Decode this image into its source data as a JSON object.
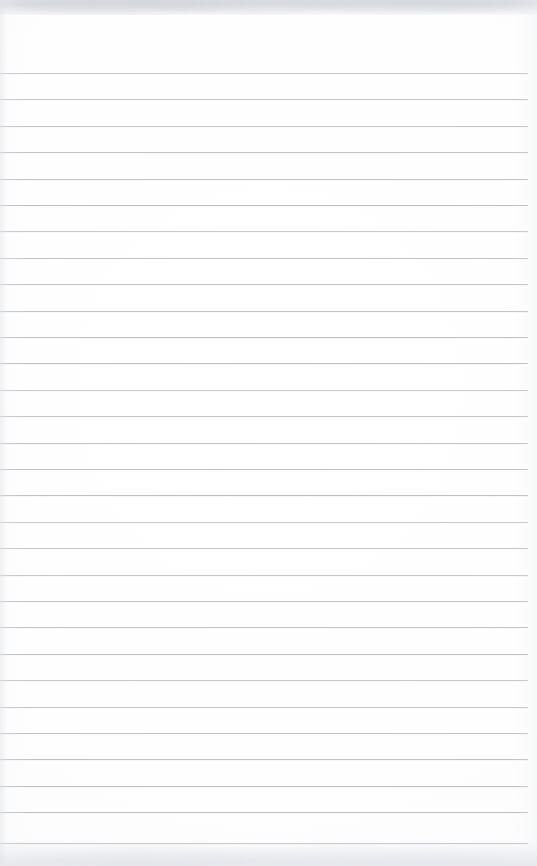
{
  "document": {
    "kind": "scanned-lined-paper",
    "title": "Blank Lined Notebook Page",
    "page_width": 537,
    "page_height": 866,
    "orientation": "portrait",
    "content_text": "",
    "has_handwriting": false,
    "has_printed_text": false
  },
  "paper": {
    "background_color": "#ffffff",
    "tint_color": "#fbfbfc",
    "edge_shadow_color": "#e0e3e8",
    "top_edge_band_height": 15,
    "bottom_edge_band_height": 24
  },
  "ruling": {
    "style": "horizontal-ruled",
    "line_color": "#b9bdc5",
    "line_thickness": 1,
    "line_spacing": 26.4,
    "first_line_y": 73,
    "last_line_y": 843,
    "line_count": 30,
    "left_inset": 0,
    "right_inset": 9,
    "margin_rule": "none",
    "y_positions": [
      73,
      99.4,
      125.8,
      152.2,
      178.6,
      205,
      231.4,
      257.8,
      284.2,
      310.6,
      337,
      363.4,
      389.8,
      416.2,
      442.6,
      469,
      495.4,
      521.8,
      548.2,
      574.6,
      601,
      627.4,
      653.8,
      680.2,
      706.6,
      733,
      759.4,
      785.8,
      812.2,
      843
    ]
  }
}
